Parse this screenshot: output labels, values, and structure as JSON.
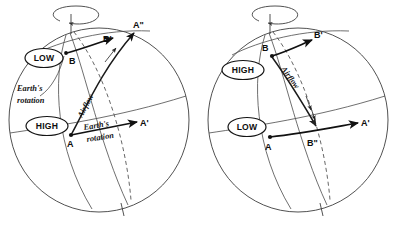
{
  "figure": {
    "background_color": "#ffffff",
    "line_color": "#3d3d3d",
    "accent_color": "#111111"
  },
  "panels": [
    {
      "id": "left-panel",
      "name": "northern-hemisphere-low-panel",
      "rotation_label": "",
      "labels": {
        "low": "LOW",
        "high": "HIGH",
        "airflow": "Airflow",
        "earths_rotation_upper": "Earth's",
        "earths_rotation_upper2": "rotation",
        "earths_rotation_lower": "Earth's",
        "earths_rotation_lower2": "rotation",
        "point_a": "A",
        "point_a_prime": "A'",
        "point_a_dprime": "A\"",
        "point_b": "B",
        "point_b_prime": "B'"
      }
    },
    {
      "id": "right-panel",
      "name": "northern-hemisphere-high-panel",
      "rotation_label": "",
      "labels": {
        "high": "HIGH",
        "low": "LOW",
        "airflow": "Airflow",
        "point_a": "A",
        "point_a_prime": "A'",
        "point_b": "B",
        "point_b_prime": "B'",
        "point_b_dprime": "B\""
      }
    }
  ]
}
